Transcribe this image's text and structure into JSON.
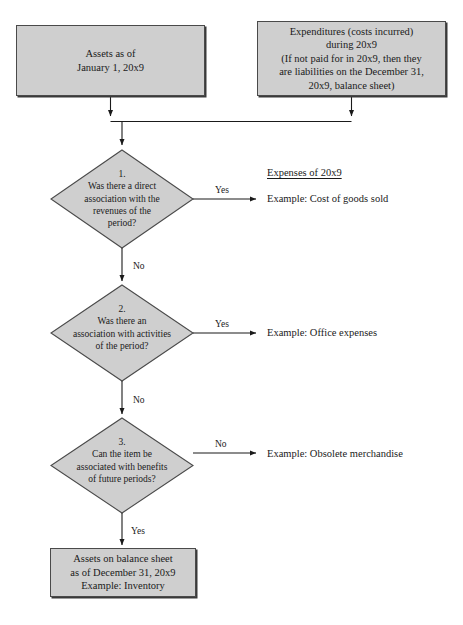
{
  "diagram": {
    "fill_color": "#cfcfcf",
    "border_color": "#4a4a4a",
    "background_color": "#ffffff"
  },
  "nodes": {
    "assets_start": {
      "text": "Assets as of\nJanuary 1, 20x9"
    },
    "expenditures": {
      "text": "Expenditures (costs incurred)\nduring 20x9\n(If not paid for in 20x9, then they\nare liabilities on the December 31,\n20x9, balance sheet)"
    },
    "decision_1": {
      "text": "1.\nWas there a direct\nassociation with the\nrevenues of the\nperiod?"
    },
    "decision_2": {
      "text": "2.\nWas there an\nassociation with activities\nof the period?"
    },
    "decision_3": {
      "text": "3.\nCan the item be\nassociated with benefits\nof future periods?"
    },
    "assets_end": {
      "text": "Assets on balance sheet\nas of December 31, 20x9\nExample: Inventory"
    }
  },
  "edge_labels": {
    "yes_1": "Yes",
    "no_1": "No",
    "yes_2": "Yes",
    "no_2": "No",
    "no_3": "No",
    "yes_3": "Yes"
  },
  "outcomes": {
    "expenses_heading": "Expenses of 20x9",
    "example_cogs": "Example: Cost of goods sold",
    "example_office": "Example: Office expenses",
    "example_obsolete": "Example: Obsolete merchandise"
  }
}
